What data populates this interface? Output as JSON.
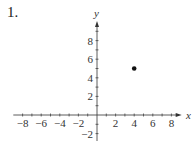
{
  "problem": {
    "number": "1."
  },
  "chart_data": {
    "type": "scatter",
    "title": "",
    "xlabel": "x",
    "ylabel": "y",
    "x": [
      4
    ],
    "y": [
      5
    ],
    "points": [
      {
        "x": 4,
        "y": 5
      }
    ],
    "xlim": [
      -9,
      9
    ],
    "ylim": [
      -3,
      10
    ],
    "x_ticks": [
      -8,
      -6,
      -4,
      -2,
      2,
      4,
      6,
      8
    ],
    "x_tick_labels": [
      "−8",
      "−6",
      "−4",
      "−2",
      "2",
      "4",
      "6",
      "8"
    ],
    "y_ticks": [
      -2,
      2,
      4,
      6,
      8
    ],
    "y_tick_labels": [
      "−2",
      "2",
      "4",
      "6",
      "8"
    ],
    "minor_tick_step": 1,
    "grid": false,
    "legend": null
  }
}
